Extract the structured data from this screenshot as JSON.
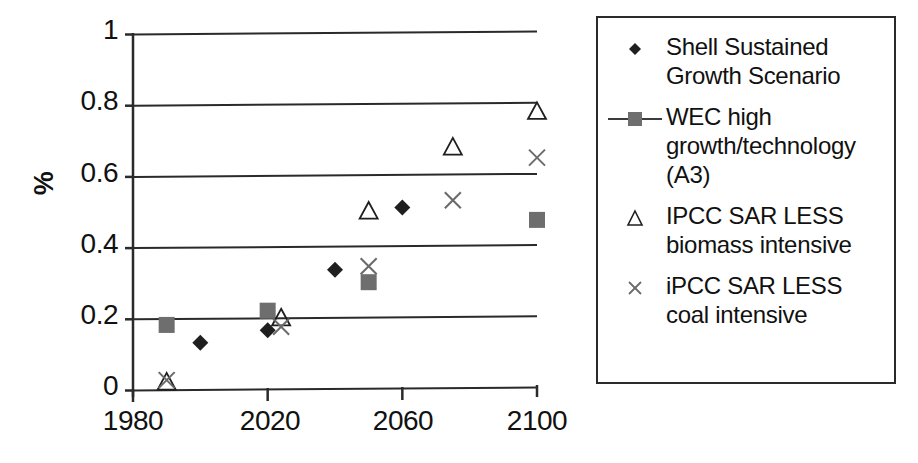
{
  "chart_data": {
    "type": "scatter",
    "title": "",
    "xlabel": "",
    "ylabel": "%",
    "xlim": [
      1980,
      2100
    ],
    "ylim": [
      0,
      1
    ],
    "xticks": [
      1980,
      2020,
      2060,
      2100
    ],
    "xtick_labels": [
      "1980",
      "2020",
      "2060",
      "2100"
    ],
    "yticks": [
      0,
      0.2,
      0.4,
      0.6,
      0.8,
      1
    ],
    "ytick_labels": [
      "0",
      "0.2",
      "0.4",
      "0.6",
      "0.8",
      "1"
    ],
    "grid": "horizontal",
    "legend_position": "right",
    "series": [
      {
        "name": "Shell Sustained Growth Scenario",
        "marker": "diamond",
        "color": "#1f1f1f",
        "line": false,
        "points": [
          {
            "x": 2000,
            "y": 0.13
          },
          {
            "x": 2020,
            "y": 0.165
          },
          {
            "x": 2040,
            "y": 0.335
          },
          {
            "x": 2060,
            "y": 0.51
          }
        ]
      },
      {
        "name": "WEC high growth/technology (A3)",
        "marker": "square",
        "color": "#6e6e6e",
        "line": true,
        "points": [
          {
            "x": 1990,
            "y": 0.18
          },
          {
            "x": 2020,
            "y": 0.22
          },
          {
            "x": 2050,
            "y": 0.3
          },
          {
            "x": 2100,
            "y": 0.475
          }
        ]
      },
      {
        "name": "IPCC SAR LESS biomass intensive",
        "marker": "triangle",
        "color": "#1f1f1f",
        "line": false,
        "points": [
          {
            "x": 1990,
            "y": 0.02
          },
          {
            "x": 2024,
            "y": 0.2
          },
          {
            "x": 2050,
            "y": 0.5
          },
          {
            "x": 2075,
            "y": 0.68
          },
          {
            "x": 2100,
            "y": 0.78
          }
        ]
      },
      {
        "name": "iPCC SAR LESS coal intensive",
        "marker": "cross",
        "color": "#6a6a6a",
        "line": false,
        "points": [
          {
            "x": 1990,
            "y": 0.025
          },
          {
            "x": 2024,
            "y": 0.175
          },
          {
            "x": 2050,
            "y": 0.345
          },
          {
            "x": 2075,
            "y": 0.53
          },
          {
            "x": 2100,
            "y": 0.65
          }
        ]
      }
    ]
  },
  "axis": {
    "y_title": "%",
    "y_labels": [
      "1",
      "0.8",
      "0.6",
      "0.4",
      "0.2",
      "0"
    ],
    "x_labels": [
      "1980",
      "2020",
      "2060",
      "2100"
    ]
  },
  "legend": {
    "entries": [
      {
        "label": "Shell Sustained Growth Scenario",
        "marker": "diamond"
      },
      {
        "label": "WEC high growth/technology (A3)",
        "marker": "square-line"
      },
      {
        "label": "IPCC SAR LESS biomass intensive",
        "marker": "triangle"
      },
      {
        "label": "iPCC SAR LESS coal intensive",
        "marker": "cross"
      }
    ]
  },
  "colors": {
    "axis": "#2a2a2a",
    "dark_marker": "#1f1f1f",
    "grey_marker": "#6e6e6e",
    "background": "#ffffff"
  }
}
